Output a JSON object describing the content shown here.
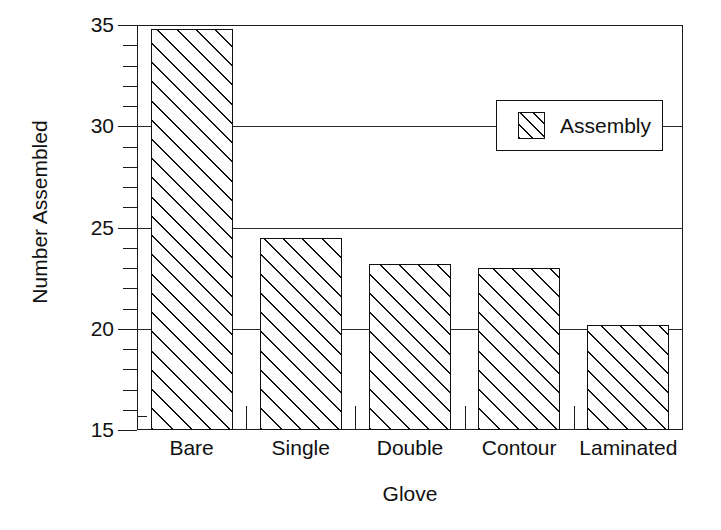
{
  "chart_data": {
    "type": "bar",
    "title": "",
    "xlabel": "Glove",
    "ylabel": "Number Assembled",
    "categories": [
      "Bare",
      "Single",
      "Double",
      "Contour",
      "Laminated"
    ],
    "values": [
      34.8,
      24.5,
      23.2,
      23.0,
      20.2
    ],
    "series": [
      {
        "name": "Assembly",
        "values": [
          34.8,
          24.5,
          23.2,
          23.0,
          20.2
        ]
      }
    ],
    "ylim": [
      15,
      35
    ],
    "ytick_labels": [
      "15",
      "20",
      "25",
      "30",
      "35"
    ],
    "ytick_values": [
      15,
      20,
      25,
      30,
      35
    ],
    "yminor_step": 1,
    "grid": "horizontal-major",
    "legend": {
      "position": "top-right",
      "entries": [
        {
          "label": "Assembly",
          "pattern": "diagonal-hatch",
          "color": "#111111"
        }
      ]
    },
    "colors": {
      "axis": "#111111",
      "grid": "#2a2a2a",
      "bar_edge": "#111111",
      "bar_fill": "#ffffff",
      "hatch": "#111111",
      "background": "#ffffff"
    }
  }
}
